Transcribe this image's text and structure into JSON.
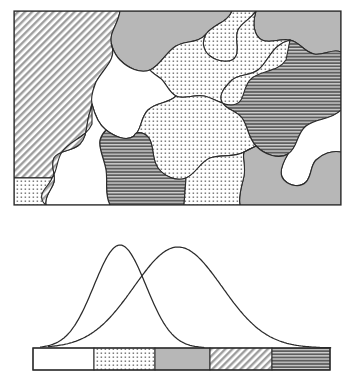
{
  "figure": {
    "title": "",
    "panels": [
      {
        "name": "microstructure-map",
        "label": "Grain microstructure map"
      },
      {
        "name": "distribution-plot",
        "label": "Overlapping distributions with classification bar"
      }
    ]
  },
  "patterns": {
    "white": {
      "key": "white",
      "label": "White (unfilled)",
      "fill": "#ffffff",
      "stroke": "#2b2b2b"
    },
    "dots": {
      "key": "dots",
      "label": "Fine dotted",
      "fill": "#f0f0f0",
      "stroke": "#2b2b2b"
    },
    "gray": {
      "key": "gray",
      "label": "Solid light gray",
      "fill": "#b5b5b5",
      "stroke": "#2b2b2b"
    },
    "diagonal": {
      "key": "diagonal",
      "label": "Diagonal hatch",
      "fill": "#d8d8d8",
      "stroke": "#2b2b2b"
    },
    "horizontal": {
      "key": "horizontal",
      "label": "Horizontal line hatch",
      "fill": "#8f8f8f",
      "stroke": "#2b2b2b"
    }
  },
  "map_panel": {
    "frame": {
      "x": 14,
      "y": 11,
      "width": 327,
      "height": 194,
      "stroke": "#2b2b2b",
      "stroke_width": 1.2
    },
    "grains": [
      {
        "id": "g1",
        "pattern": "diagonal",
        "path": "M14,11 L120,11 C118,26 108,32 112,46 C116,60 104,68 96,82 C88,96 98,110 92,124 C86,138 70,140 62,152 C56,161 58,170 52,178 L14,178 Z"
      },
      {
        "id": "g2",
        "pattern": "gray",
        "path": "M120,11 L232,11 C228,22 214,24 206,34 C198,44 186,40 176,46 C166,52 160,66 150,70 C140,74 128,68 120,60 C112,52 110,38 112,46 C108,32 118,26 120,11 Z"
      },
      {
        "id": "g3",
        "pattern": "dots",
        "path": "M232,11 L256,11 C250,20 242,22 238,30 C234,38 240,48 236,56 C232,64 218,62 210,56 C202,50 202,40 206,34 C214,24 228,22 232,11 Z"
      },
      {
        "id": "g4",
        "pattern": "gray",
        "path": "M256,11 L341,11 L341,52 C332,48 324,56 314,54 C304,52 300,42 290,40 C280,38 270,44 262,40 C254,36 252,24 256,11 Z"
      },
      {
        "id": "g5",
        "pattern": "dots",
        "path": "M150,70 C160,66 166,52 176,46 C186,40 198,44 206,34 C202,40 202,50 210,56 C218,62 232,64 236,56 C240,48 234,38 238,30 C242,22 250,20 256,11 C252,24 254,36 262,40 C270,44 280,38 290,40 L286,60 C278,72 262,70 252,78 C242,86 246,100 236,104 C226,108 214,98 204,96 C194,94 184,100 176,96 C168,92 166,82 160,78 C156,75 152,73 150,70 Z"
      },
      {
        "id": "g6",
        "pattern": "white",
        "path": "M96,82 C104,68 116,60 112,46 C110,38 112,52 120,60 C128,68 140,74 150,70 C152,73 156,75 160,78 C166,82 168,92 176,96 C168,104 156,102 148,110 C140,118 142,130 134,136 C126,142 114,136 106,130 C98,124 94,112 92,104 C90,96 94,88 96,82 Z"
      },
      {
        "id": "g7",
        "pattern": "horizontal",
        "path": "M290,40 C300,42 304,52 314,54 C324,56 332,48 341,52 L341,110 C332,120 316,118 306,126 C296,134 298,148 288,154 C278,160 264,154 256,146 C248,138 248,126 242,118 C236,110 226,110 222,102 C218,94 226,86 232,80 C238,74 250,76 258,70 C266,64 270,52 278,46 C282,43 286,41 290,40 Z"
      },
      {
        "id": "g8",
        "pattern": "dots",
        "path": "M286,60 L290,40 C286,41 282,43 278,46 C270,52 266,64 258,70 C250,76 238,74 232,80 C226,86 218,94 222,102 C226,110 236,110 242,118 C248,126 248,138 256,146 L244,152 C234,158 220,154 210,158 C200,162 196,174 186,178 C176,182 164,176 158,168 C152,160 154,148 150,140 C146,132 136,130 134,136 C142,130 140,118 148,110 C156,102 168,104 176,96 C184,100 194,94 204,96 C214,98 226,108 236,104 C246,100 242,86 252,78 C262,70 278,72 286,60 Z"
      },
      {
        "id": "g9",
        "pattern": "horizontal",
        "path": "M106,130 C114,136 126,142 134,136 C136,130 146,132 150,140 C154,148 152,160 158,168 C164,176 176,182 186,178 L184,205 L110,205 C104,194 108,182 106,170 C104,158 98,148 100,140 C101,136 103,133 106,130 Z"
      },
      {
        "id": "g10",
        "pattern": "white",
        "path": "M92,104 C94,112 98,124 106,130 C103,133 101,136 100,140 C98,148 104,158 106,170 C108,182 104,194 110,205 L46,205 C44,196 52,190 54,182 C56,174 50,166 54,158 C58,150 72,152 80,144 C88,136 86,122 90,112 C91,109 91,106 92,104 Z"
      },
      {
        "id": "g11",
        "pattern": "diagonal",
        "path": "M52,178 C58,170 56,161 62,152 C70,140 86,138 92,124 C92,118 92,110 92,104 C91,106 91,109 90,112 C86,122 88,136 80,144 C72,152 58,150 54,158 C50,166 56,174 54,182 C52,190 44,196 46,205 L14,205 L14,178 Z"
      },
      {
        "id": "g12",
        "pattern": "dots",
        "path": "M14,178 L52,178 C50,184 44,188 42,194 C41,198 42,202 46,205 L14,205 Z"
      },
      {
        "id": "g13",
        "pattern": "white",
        "path": "M341,110 L341,152 C332,150 322,154 316,160 C310,166 312,176 306,182 C300,188 290,186 284,180 C278,174 282,164 288,154 C298,148 296,134 306,126 C316,118 332,120 341,110 Z"
      },
      {
        "id": "g14",
        "pattern": "gray",
        "path": "M288,154 C282,164 278,174 284,180 C290,186 300,188 306,182 C312,176 310,166 316,160 C322,154 332,150 341,152 L341,205 L240,205 C238,196 242,186 244,176 C246,166 242,158 244,152 L256,146 C264,154 278,160 288,154 Z"
      },
      {
        "id": "g15",
        "pattern": "dots",
        "path": "M256,146 L244,152 C242,158 246,166 244,176 C242,186 238,196 240,205 L184,205 L186,178 C196,174 200,162 210,158 C220,154 234,158 244,152 Z"
      }
    ]
  },
  "chart_data": {
    "type": "line",
    "title": "",
    "xlabel": "",
    "ylabel": "",
    "xlim": [
      0,
      100
    ],
    "ylim": [
      0,
      1
    ],
    "grid": false,
    "legend_position": "none",
    "series": [
      {
        "name": "distribution-1",
        "label": "Narrow distribution",
        "mean": 30,
        "sigma": 10,
        "peak_x": 120,
        "peak_y": 245,
        "amplitude": 1.0,
        "color": "#2b2b2b"
      },
      {
        "name": "distribution-2",
        "label": "Broad distribution",
        "mean": 50,
        "sigma": 17,
        "peak_x": 178,
        "peak_y": 247,
        "amplitude": 0.98,
        "color": "#2b2b2b"
      }
    ],
    "crossing_point": {
      "x": 145,
      "y": 265
    },
    "baseline_y": 348
  },
  "class_bar": {
    "frame": {
      "x": 33,
      "y": 348,
      "width": 297,
      "height": 22,
      "stroke": "#2b2b2b",
      "stroke_width": 1.2
    },
    "segments": [
      {
        "index": 0,
        "pattern": "white",
        "label": "Class 1",
        "x": 33,
        "width": 61
      },
      {
        "index": 1,
        "pattern": "dots",
        "label": "Class 2",
        "x": 94,
        "width": 61
      },
      {
        "index": 2,
        "pattern": "gray",
        "label": "Class 3",
        "x": 155,
        "width": 55
      },
      {
        "index": 3,
        "pattern": "diagonal",
        "label": "Class 4",
        "x": 210,
        "width": 62
      },
      {
        "index": 4,
        "pattern": "horizontal",
        "label": "Class 5",
        "x": 272,
        "width": 58
      }
    ]
  }
}
